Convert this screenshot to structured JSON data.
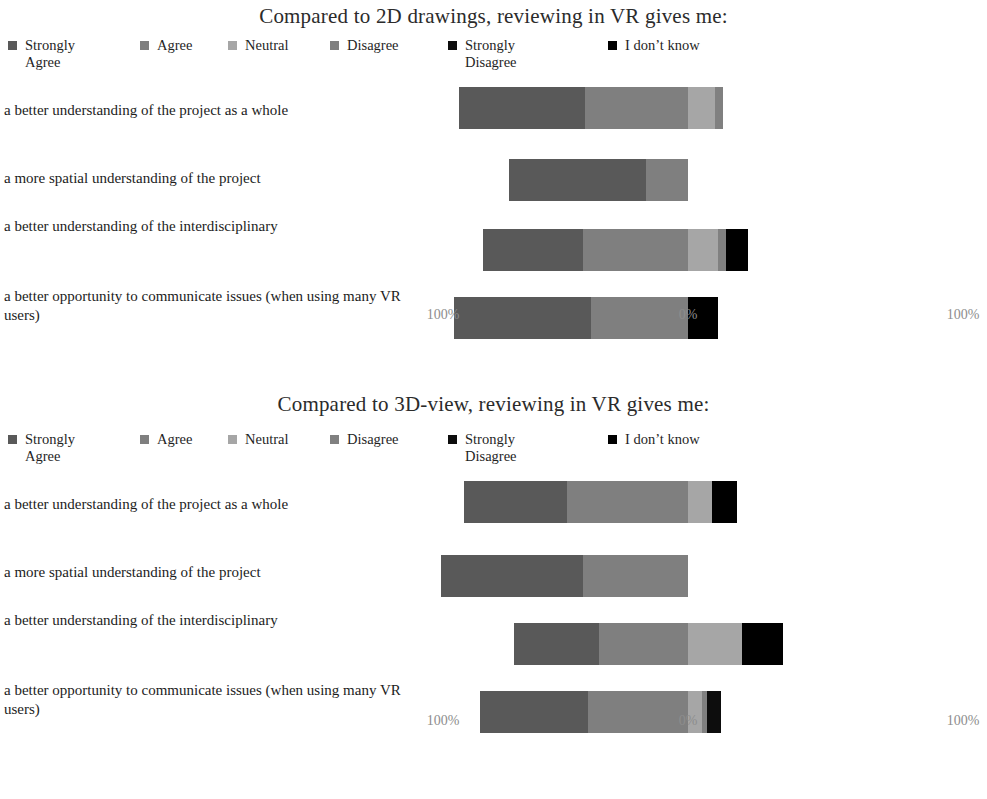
{
  "colors": {
    "strongly_agree": "#595959",
    "agree": "#7f7f7f",
    "neutral": "#a6a6a6",
    "disagree": "#808080",
    "strongly_disagree": "#0d0d0d",
    "i_dont_know": "#000000",
    "tick_text": "#8d8d8d",
    "title_text": "#2b2b2b"
  },
  "legend": {
    "items": [
      {
        "label": "Strongly Agree",
        "color_key": "strongly_agree",
        "two_line": true
      },
      {
        "label": "Agree",
        "color_key": "agree",
        "two_line": false
      },
      {
        "label": "Neutral",
        "color_key": "neutral",
        "two_line": false
      },
      {
        "label": "Disagree",
        "color_key": "disagree",
        "two_line": false
      },
      {
        "label": "Strongly Disagree",
        "color_key": "strongly_disagree",
        "two_line": true
      },
      {
        "label": "I don’t know",
        "color_key": "i_dont_know",
        "two_line": false
      }
    ]
  },
  "axis": {
    "ticks": [
      {
        "label": "100%",
        "value": -100
      },
      {
        "label": "0%",
        "value": 0
      },
      {
        "label": "100%",
        "value": 100
      }
    ]
  },
  "chart_data": [
    {
      "type": "bar",
      "subtype": "diverging-stacked-bar",
      "title": "Compared to 2D drawings, reviewing in VR gives me:",
      "xlabel": "",
      "ylabel": "",
      "xlim": [
        -100,
        100
      ],
      "grid": false,
      "legend_position": "top",
      "orientation": "horizontal",
      "stacked": true,
      "categories": [
        "a better understanding of the project as a whole",
        "a more spatial understanding of the project",
        "a better understanding of the interdisciplinary",
        "a better opportunity to communicate issues (when using many VR users)"
      ],
      "series": [
        {
          "name": "Strongly Agree",
          "color_key": "strongly_agree",
          "values": [
            48,
            52,
            38,
            52
          ]
        },
        {
          "name": "Agree",
          "color_key": "agree",
          "values": [
            39,
            16,
            40,
            37
          ]
        },
        {
          "name": "Neutral",
          "color_key": "neutral",
          "values": [
            10,
            0,
            11,
            0
          ]
        },
        {
          "name": "Disagree",
          "color_key": "disagree",
          "values": [
            3,
            0,
            3,
            0
          ]
        },
        {
          "name": "Strongly Disagree",
          "color_key": "strongly_disagree",
          "values": [
            0,
            0,
            0,
            0
          ]
        },
        {
          "name": "I don’t know",
          "color_key": "i_dont_know",
          "values": [
            0,
            0,
            8,
            11
          ]
        }
      ]
    },
    {
      "type": "bar",
      "subtype": "diverging-stacked-bar",
      "title": "Compared to 3D-view, reviewing in VR gives me:",
      "xlabel": "",
      "ylabel": "",
      "xlim": [
        -100,
        100
      ],
      "grid": false,
      "legend_position": "top",
      "orientation": "horizontal",
      "stacked": true,
      "categories": [
        "a better understanding of the project as a whole",
        "a more spatial understanding of the project",
        "a better understanding of the interdisciplinary",
        "a better opportunity to communicate issues (when using many VR users)"
      ],
      "series": [
        {
          "name": "Strongly Agree",
          "color_key": "strongly_agree",
          "values": [
            39,
            54,
            32,
            41
          ]
        },
        {
          "name": "Agree",
          "color_key": "agree",
          "values": [
            46,
            40,
            34,
            38
          ]
        },
        {
          "name": "Neutral",
          "color_key": "neutral",
          "values": [
            9,
            0,
            20,
            5
          ]
        },
        {
          "name": "Disagree",
          "color_key": "disagree",
          "values": [
            0,
            0,
            0,
            2
          ]
        },
        {
          "name": "Strongly Disagree",
          "color_key": "strongly_disagree",
          "values": [
            0,
            0,
            0,
            5
          ]
        },
        {
          "name": "I don’t know",
          "color_key": "i_dont_know",
          "values": [
            9,
            0,
            15,
            0
          ]
        }
      ]
    }
  ]
}
